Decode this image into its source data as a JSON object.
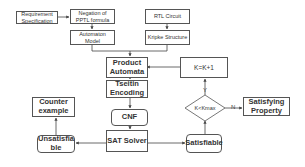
{
  "nodes": {
    "requirement": "Requirement Specification",
    "negation": "Negation of PPTL formula",
    "automaton": "Automaton Model",
    "rtl": "RTL Circuit",
    "kripke": "Kripke Structure",
    "product": "Product Automata",
    "increment": "K=K+1",
    "tseitin": "Tseitin Encoding",
    "cnf": "CNF",
    "sat": "SAT Solver",
    "counter": "Counter example",
    "unsat": "Unsatisfiable",
    "satisfiable": "Satisfiable",
    "decision": "K<Kmax",
    "satisfying": "Satisfying Property"
  },
  "edge_labels": {
    "yes": "Y",
    "no": "N"
  }
}
